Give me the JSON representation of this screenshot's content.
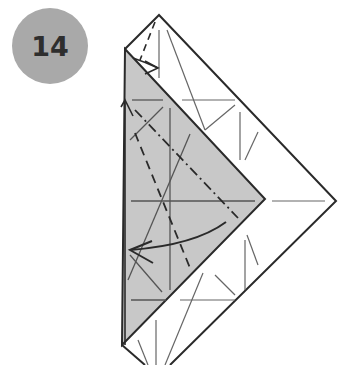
{
  "step": {
    "number": "14"
  },
  "colors": {
    "badge": "#a9a9a9",
    "shade": "#c8c8c8",
    "line": "#2a2a2a",
    "crease": "#555555"
  },
  "diagram": {
    "type": "origami-step",
    "elements": [
      "outer-square-diamond",
      "shaded-triangle-flap",
      "valley-fold-line",
      "mountain-fold-line",
      "fold-arrow",
      "small-flap-arrow"
    ]
  }
}
